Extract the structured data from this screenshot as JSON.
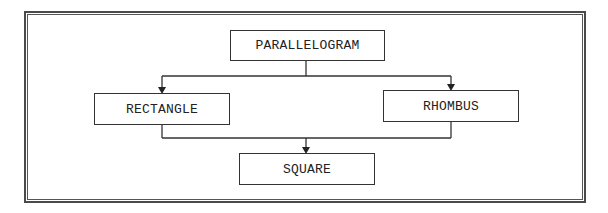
{
  "diagram": {
    "type": "hierarchy",
    "nodes": {
      "parallelogram": "PARALLELOGRAM",
      "rectangle": "RECTANGLE",
      "rhombus": "RHOMBUS",
      "square": "SQUARE"
    },
    "edges": [
      {
        "from": "PARALLELOGRAM",
        "to": "RECTANGLE"
      },
      {
        "from": "PARALLELOGRAM",
        "to": "RHOMBUS"
      },
      {
        "from": "RECTANGLE",
        "to": "SQUARE"
      },
      {
        "from": "RHOMBUS",
        "to": "SQUARE"
      }
    ],
    "colors": {
      "line": "#333333",
      "background": "#ffffff"
    }
  }
}
